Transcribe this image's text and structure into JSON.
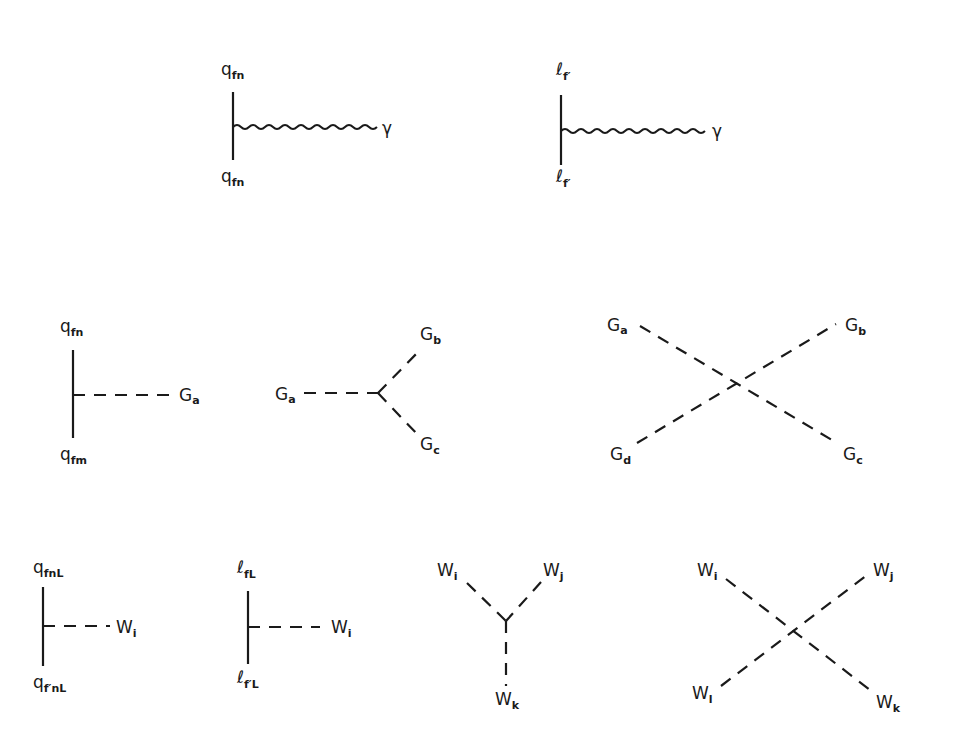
{
  "diagram": {
    "rows": [
      {
        "name": "electromagnetic",
        "vertices": [
          {
            "id": "quark-photon",
            "labels": {
              "top": {
                "base": "q",
                "sub": "fn"
              },
              "bottom": {
                "base": "q",
                "sub": "fn"
              },
              "right": {
                "base": "γ",
                "sub": ""
              }
            }
          },
          {
            "id": "lepton-photon",
            "labels": {
              "top": {
                "base": "ℓ",
                "sub": "f′"
              },
              "bottom": {
                "base": "ℓ",
                "sub": "f′"
              },
              "right": {
                "base": "γ",
                "sub": ""
              }
            }
          }
        ]
      },
      {
        "name": "strong",
        "vertices": [
          {
            "id": "quark-gluon",
            "labels": {
              "top": {
                "base": "q",
                "sub": "fn"
              },
              "bottom": {
                "base": "q",
                "sub": "fm"
              },
              "right": {
                "base": "G",
                "sub": "a"
              }
            }
          },
          {
            "id": "three-gluon",
            "labels": {
              "left": {
                "base": "G",
                "sub": "a"
              },
              "upper_right": {
                "base": "G",
                "sub": "b"
              },
              "lower_right": {
                "base": "G",
                "sub": "c"
              }
            }
          },
          {
            "id": "four-gluon",
            "labels": {
              "upper_left": {
                "base": "G",
                "sub": "a"
              },
              "upper_right": {
                "base": "G",
                "sub": "b"
              },
              "lower_right": {
                "base": "G",
                "sub": "c"
              },
              "lower_left": {
                "base": "G",
                "sub": "d"
              }
            }
          }
        ]
      },
      {
        "name": "weak",
        "vertices": [
          {
            "id": "quark-W",
            "labels": {
              "top": {
                "base": "q",
                "sub": "fnL"
              },
              "bottom": {
                "base": "q",
                "sub": "f′nL"
              },
              "right": {
                "base": "W",
                "sub": "i"
              }
            }
          },
          {
            "id": "lepton-W",
            "labels": {
              "top": {
                "base": "ℓ",
                "sub": "fL"
              },
              "bottom": {
                "base": "ℓ",
                "sub": "f′L"
              },
              "right": {
                "base": "W",
                "sub": "i"
              }
            }
          },
          {
            "id": "three-W",
            "labels": {
              "upper_left": {
                "base": "W",
                "sub": "i"
              },
              "upper_right": {
                "base": "W",
                "sub": "j"
              },
              "bottom": {
                "base": "W",
                "sub": "k"
              }
            }
          },
          {
            "id": "four-W",
            "labels": {
              "upper_left": {
                "base": "W",
                "sub": "i"
              },
              "upper_right": {
                "base": "W",
                "sub": "j"
              },
              "lower_right": {
                "base": "W",
                "sub": "k"
              },
              "lower_left": {
                "base": "W",
                "sub": "l"
              }
            }
          }
        ]
      }
    ]
  }
}
